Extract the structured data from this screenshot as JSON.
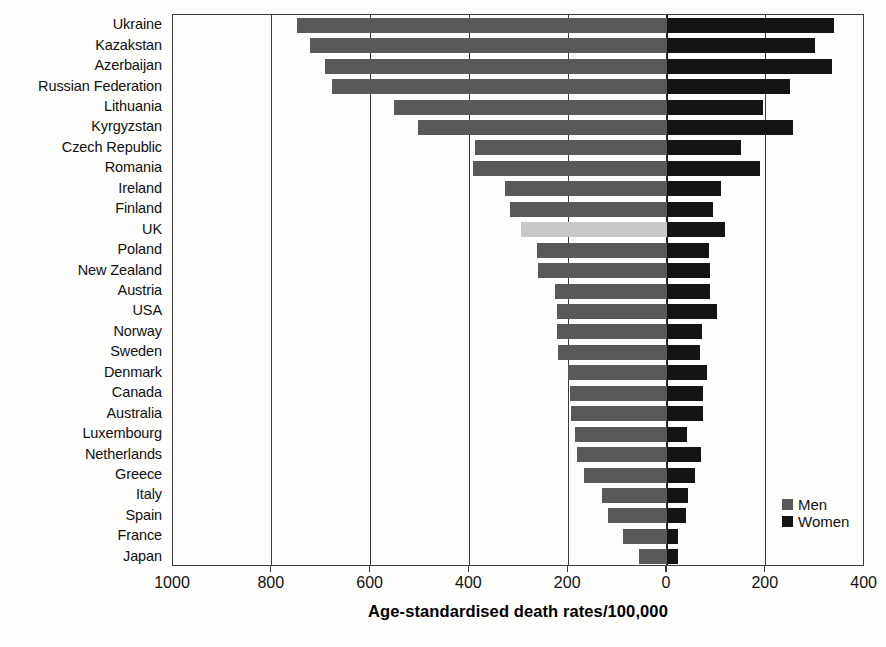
{
  "chart_data": {
    "type": "bar",
    "orientation": "horizontal-diverging",
    "title": "",
    "xlabel": "Age-standardised death rates/100,000",
    "ylabel": "",
    "grid": true,
    "legend_position": "bottom-right",
    "axis": {
      "left_max": 1000,
      "right_max": 400,
      "tick_labels": [
        "1000",
        "800",
        "600",
        "400",
        "200",
        "0",
        "200",
        "400"
      ],
      "tick_values": [
        1000,
        800,
        600,
        400,
        200,
        0,
        200,
        400
      ]
    },
    "categories": [
      "Ukraine",
      "Kazakstan",
      "Azerbaijan",
      "Russian Federation",
      "Lithuania",
      "Kyrgyzstan",
      "Czech Republic",
      "Romania",
      "Ireland",
      "Finland",
      "UK",
      "Poland",
      "New Zealand",
      "Austria",
      "USA",
      "Norway",
      "Sweden",
      "Denmark",
      "Canada",
      "Australia",
      "Luxembourg",
      "Netherlands",
      "Greece",
      "Italy",
      "Spain",
      "France",
      "Japan"
    ],
    "highlight_category": "UK",
    "series": [
      {
        "name": "Men",
        "color": "#595959",
        "direction": "left",
        "values": [
          750,
          722,
          693,
          678,
          553,
          505,
          388,
          392,
          328,
          318,
          296,
          263,
          262,
          227,
          223,
          222,
          221,
          201,
          197,
          194,
          186,
          182,
          168,
          132,
          120,
          90,
          57
        ]
      },
      {
        "name": "Women",
        "color": "#141414",
        "direction": "right",
        "values": [
          338,
          299,
          334,
          248,
          195,
          255,
          150,
          188,
          110,
          93,
          118,
          86,
          87,
          88,
          101,
          70,
          67,
          80,
          72,
          73,
          40,
          68,
          56,
          42,
          38,
          23,
          22
        ]
      }
    ]
  },
  "legend": {
    "items": [
      {
        "label": "Men",
        "color": "#595959",
        "swatch": "square-swatch"
      },
      {
        "label": "Women",
        "color": "#141414",
        "swatch": "square-swatch"
      }
    ]
  }
}
